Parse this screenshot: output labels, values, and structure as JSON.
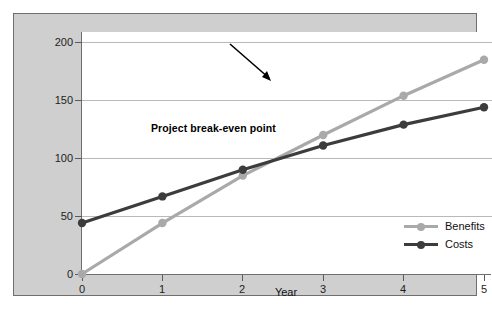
{
  "chart_data": {
    "type": "line",
    "title": "",
    "xlabel": "Year",
    "ylabel": "Dollars ($ thousands)",
    "x": [
      0,
      1,
      2,
      3,
      4,
      5
    ],
    "xticklabels": [
      "0",
      "1",
      "2",
      "3",
      "4",
      "5"
    ],
    "yticks": [
      0,
      50,
      100,
      150,
      200
    ],
    "yticklabels": [
      "0",
      "50",
      "100",
      "150",
      "200"
    ],
    "xlim": [
      0,
      5
    ],
    "ylim": [
      0,
      209
    ],
    "grid": "horizontal",
    "legend_position": "lower-right-inside",
    "series": [
      {
        "name": "Benefits",
        "color": "#a9a9a9",
        "values": [
          0,
          44,
          85,
          120,
          154,
          185
        ]
      },
      {
        "name": "Costs",
        "color": "#3c3c3c",
        "values": [
          44,
          67,
          90,
          111,
          129,
          144
        ]
      }
    ],
    "annotations": [
      {
        "text": "Project break-even point",
        "target_x": 2.38,
        "target_y": 100,
        "color": "#000000"
      }
    ]
  },
  "legend": {
    "items": [
      {
        "label": "Benefits"
      },
      {
        "label": "Costs"
      }
    ]
  },
  "colors": {
    "panel_background": "#cfcfcf",
    "plot_background": "#ffffff",
    "axis": "#6f6f6f",
    "gridline": "#b9b9b9",
    "benefits": "#a9a9a9",
    "costs": "#3c3c3c",
    "text": "#111111"
  }
}
